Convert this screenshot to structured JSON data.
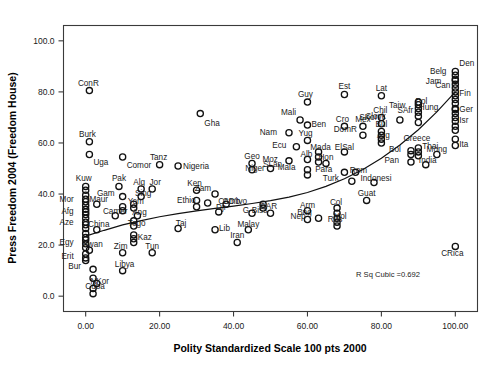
{
  "chart_data": {
    "type": "scatter",
    "title": "",
    "xlabel": "Polity Standardized Scale 100 pts 2000",
    "ylabel": "Press Freedom 2004 (Freedom House)",
    "xlim": [
      -6,
      106
    ],
    "ylim": [
      -6,
      106
    ],
    "xticks": [
      0,
      20,
      40,
      60,
      80,
      100
    ],
    "xticklabels": [
      "0.00",
      "20.00",
      "40.00",
      "60.00",
      "80.00",
      "100.00"
    ],
    "yticks": [
      0,
      20,
      40,
      60,
      80,
      100
    ],
    "yticklabels": [
      "0.0",
      "20.0",
      "40.0",
      "60.0",
      "80.0",
      "100.0"
    ],
    "grid": false,
    "legend": false,
    "annotation": "R Sq Cubic =0.692",
    "fit": {
      "kind": "cubic",
      "r_squared": 0.692,
      "label": "R Sq Cubic =0.692",
      "curve": [
        [
          0,
          23.5
        ],
        [
          5,
          25.8
        ],
        [
          10,
          27.9
        ],
        [
          15,
          29.6
        ],
        [
          20,
          31.1
        ],
        [
          25,
          32.3
        ],
        [
          30,
          33.4
        ],
        [
          35,
          34.4
        ],
        [
          40,
          35.3
        ],
        [
          45,
          36.3
        ],
        [
          50,
          37.4
        ],
        [
          55,
          38.8
        ],
        [
          60,
          40.6
        ],
        [
          65,
          43.0
        ],
        [
          70,
          46.0
        ],
        [
          75,
          49.6
        ],
        [
          80,
          54.0
        ],
        [
          85,
          59.2
        ],
        [
          90,
          65.2
        ],
        [
          95,
          72.2
        ],
        [
          100,
          80.0
        ]
      ]
    },
    "points": [
      {
        "label": "ConR",
        "x": 1,
        "y": 80.5,
        "lx": -1,
        "ly": 8
      },
      {
        "label": "Gha",
        "x": 31,
        "y": 71.5,
        "lx": 4,
        "ly": -9
      },
      {
        "label": "Burk",
        "x": 1,
        "y": 60.5,
        "lx": -2,
        "ly": 8
      },
      {
        "label": "Uga",
        "x": 1,
        "y": 55.5,
        "lx": 4,
        "ly": -8
      },
      {
        "label": "Comor",
        "x": 10,
        "y": 54.5,
        "lx": 4,
        "ly": -8
      },
      {
        "label": "Tanz",
        "x": 20,
        "y": 51.5,
        "lx": -1,
        "ly": 8
      },
      {
        "label": "Nigeria",
        "x": 25,
        "y": 51.0,
        "lx": 5,
        "ly": 0
      },
      {
        "label": "Guy",
        "x": 60,
        "y": 76.0,
        "lx": -2,
        "ly": 8
      },
      {
        "label": "Est",
        "x": 70,
        "y": 79.0,
        "lx": 0,
        "ly": 8
      },
      {
        "label": "Lat",
        "x": 80,
        "y": 78.5,
        "lx": 0,
        "ly": 8
      },
      {
        "label": "Belg",
        "x": 100,
        "y": 85.0,
        "lx": -9,
        "ly": 8
      },
      {
        "label": "Den",
        "x": 100,
        "y": 88.0,
        "lx": 4,
        "ly": 8
      },
      {
        "label": "Jam",
        "x": 100,
        "y": 81.5,
        "lx": -14,
        "ly": 7
      },
      {
        "label": "Can",
        "x": 100,
        "y": 80.0,
        "lx": -5,
        "ly": 7
      },
      {
        "label": "Fin",
        "x": 100,
        "y": 78.5,
        "lx": 4,
        "ly": 3
      },
      {
        "label": "Pol",
        "x": 90,
        "y": 76.0,
        "lx": 3,
        "ly": 1
      },
      {
        "label": "Taiw",
        "x": 90,
        "y": 75.0,
        "lx": -13,
        "ly": 0
      },
      {
        "label": "Mali",
        "x": 58,
        "y": 69.0,
        "lx": -4,
        "ly": 8
      },
      {
        "label": "Ben",
        "x": 60,
        "y": 67.0,
        "lx": 4,
        "ly": 1
      },
      {
        "label": "Chil",
        "x": 80,
        "y": 70.0,
        "lx": -1,
        "ly": 7
      },
      {
        "label": "Cro",
        "x": 70,
        "y": 66.5,
        "lx": -2,
        "ly": 7
      },
      {
        "label": "Mex",
        "x": 75,
        "y": 66.5,
        "lx": 0,
        "ly": 7
      },
      {
        "label": "SKor",
        "x": 80,
        "y": 67.5,
        "lx": -4,
        "ly": 7
      },
      {
        "label": "Hung",
        "x": 100,
        "y": 73.5,
        "lx": -17,
        "ly": 1
      },
      {
        "label": "Ger",
        "x": 100,
        "y": 73.0,
        "lx": 4,
        "ly": 1
      },
      {
        "label": "SAfr",
        "x": 90,
        "y": 70.5,
        "lx": -5,
        "ly": 6
      },
      {
        "label": "Slovk",
        "x": 85,
        "y": 69.0,
        "lx": -14,
        "ly": 4
      },
      {
        "label": "Isr",
        "x": 100,
        "y": 68.5,
        "lx": 4,
        "ly": 1
      },
      {
        "label": "Nam",
        "x": 55,
        "y": 64.0,
        "lx": -12,
        "ly": 1
      },
      {
        "label": "Yug",
        "x": 60,
        "y": 61.0,
        "lx": -2,
        "ly": 7
      },
      {
        "label": "Bul",
        "x": 80,
        "y": 64.5,
        "lx": 0,
        "ly": 7
      },
      {
        "label": "DomR",
        "x": 75,
        "y": 63.0,
        "lx": -6,
        "ly": 6
      },
      {
        "label": "Arg",
        "x": 80,
        "y": 61.5,
        "lx": 2,
        "ly": 4
      },
      {
        "label": "Greece",
        "x": 100,
        "y": 61.5,
        "lx": -25,
        "ly": 1
      },
      {
        "label": "Ita",
        "x": 100,
        "y": 59.0,
        "lx": 4,
        "ly": 2
      },
      {
        "label": "Ecu",
        "x": 57,
        "y": 58.5,
        "lx": -10,
        "ly": 2
      },
      {
        "label": "Mada",
        "x": 63,
        "y": 56.5,
        "lx": 2,
        "ly": 5
      },
      {
        "label": "ElSal",
        "x": 70,
        "y": 56.5,
        "lx": 0,
        "ly": 5
      },
      {
        "label": "Bol",
        "x": 88,
        "y": 57.0,
        "lx": -10,
        "ly": 2
      },
      {
        "label": "Thai",
        "x": 90,
        "y": 58.0,
        "lx": 4,
        "ly": 2
      },
      {
        "label": "Mong",
        "x": 95,
        "y": 55.5,
        "lx": 0,
        "ly": 5
      },
      {
        "label": "Moz",
        "x": 55,
        "y": 53.0,
        "lx": -11,
        "ly": 2
      },
      {
        "label": "Alb",
        "x": 60,
        "y": 53.5,
        "lx": -1,
        "ly": 6
      },
      {
        "label": "Hon",
        "x": 65,
        "y": 52.0,
        "lx": 0,
        "ly": 6
      },
      {
        "label": "Pan",
        "x": 88,
        "y": 52.5,
        "lx": -12,
        "ly": 2
      },
      {
        "label": "India",
        "x": 92,
        "y": 51.5,
        "lx": 2,
        "ly": 5
      },
      {
        "label": "Geo",
        "x": 45,
        "y": 52.0,
        "lx": 0,
        "ly": 7
      },
      {
        "label": "Niger",
        "x": 45,
        "y": 49.5,
        "lx": 3,
        "ly": 2
      },
      {
        "label": "SLan",
        "x": 50,
        "y": 50.0,
        "lx": 2,
        "ly": 5
      },
      {
        "label": "Mala",
        "x": 60,
        "y": 49.5,
        "lx": -12,
        "ly": 3
      },
      {
        "label": "Para",
        "x": 70,
        "y": 48.5,
        "lx": -12,
        "ly": 3
      },
      {
        "label": "Rom",
        "x": 73,
        "y": 48.5,
        "lx": 3,
        "ly": 2
      },
      {
        "label": "Turk",
        "x": 72,
        "y": 45.0,
        "lx": -13,
        "ly": 3
      },
      {
        "label": "Indonesi",
        "x": 78,
        "y": 44.5,
        "lx": 2,
        "ly": 5
      },
      {
        "label": "Kuw",
        "x": 0,
        "y": 43.0,
        "lx": -2,
        "ly": 8
      },
      {
        "label": "Pak",
        "x": 9,
        "y": 43.0,
        "lx": 0,
        "ly": 8
      },
      {
        "label": "Alg",
        "x": 15,
        "y": 42.0,
        "lx": -2,
        "ly": 7
      },
      {
        "label": "Jor",
        "x": 18,
        "y": 42.0,
        "lx": 3,
        "ly": 7
      },
      {
        "label": "Ken",
        "x": 30,
        "y": 41.5,
        "lx": -2,
        "ly": 7
      },
      {
        "label": "Zam",
        "x": 35,
        "y": 40.0,
        "lx": -4,
        "ly": 6
      },
      {
        "label": "Gam",
        "x": 10,
        "y": 39.0,
        "lx": -8,
        "ly": 4
      },
      {
        "label": "Sing",
        "x": 15,
        "y": 39.0,
        "lx": 2,
        "ly": 4
      },
      {
        "label": "Mor",
        "x": 0,
        "y": 37.0,
        "lx": -12,
        "ly": 3
      },
      {
        "label": "Maur",
        "x": 3,
        "y": 36.0,
        "lx": 2,
        "ly": 5
      },
      {
        "label": "Yem",
        "x": 13,
        "y": 36.0,
        "lx": 2,
        "ly": 3
      },
      {
        "label": "Ethio",
        "x": 33,
        "y": 36.5,
        "lx": -12,
        "ly": 3
      },
      {
        "label": "Camb",
        "x": 38,
        "y": 36.0,
        "lx": 3,
        "ly": 3
      },
      {
        "label": "CD'Ivo",
        "x": 48,
        "y": 36.0,
        "lx": -16,
        "ly": 3
      },
      {
        "label": "Afg",
        "x": 0,
        "y": 32.0,
        "lx": -12,
        "ly": 3
      },
      {
        "label": "Camer",
        "x": 8,
        "y": 31.5,
        "lx": 0,
        "ly": 5
      },
      {
        "label": "Ang",
        "x": 14,
        "y": 31.5,
        "lx": 2,
        "ly": 4
      },
      {
        "label": "Dji",
        "x": 36,
        "y": 33.0,
        "lx": 2,
        "ly": 5
      },
      {
        "label": "G-Biss",
        "x": 45,
        "y": 32.5,
        "lx": 3,
        "ly": 3
      },
      {
        "label": "Aze",
        "x": 0,
        "y": 28.0,
        "lx": -12,
        "ly": 3
      },
      {
        "label": "China",
        "x": 3,
        "y": 26.0,
        "lx": 2,
        "ly": 6
      },
      {
        "label": "Togo",
        "x": 13,
        "y": 27.5,
        "lx": 3,
        "ly": 3
      },
      {
        "label": "Taj",
        "x": 25,
        "y": 26.5,
        "lx": 3,
        "ly": 6
      },
      {
        "label": "Lib",
        "x": 35,
        "y": 26.0,
        "lx": 4,
        "ly": 2
      },
      {
        "label": "Malay",
        "x": 44,
        "y": 26.0,
        "lx": 0,
        "ly": 6
      },
      {
        "label": "Arm",
        "x": 60,
        "y": 33.5,
        "lx": 0,
        "ly": 6
      },
      {
        "label": "Col",
        "x": 68,
        "y": 34.5,
        "lx": -1,
        "ly": 6
      },
      {
        "label": "Nep",
        "x": 63,
        "y": 30.5,
        "lx": -13,
        "ly": 2
      },
      {
        "label": "Mol",
        "x": 68,
        "y": 30.5,
        "lx": 3,
        "ly": 2
      },
      {
        "label": "Bng",
        "x": 60,
        "y": 30.0,
        "lx": -3,
        "ly": 8
      },
      {
        "label": "Rus",
        "x": 68,
        "y": 27.5,
        "lx": -2,
        "ly": 7
      },
      {
        "label": "CAR",
        "x": 50,
        "y": 32.5,
        "lx": -2,
        "ly": 7
      },
      {
        "label": "Guat",
        "x": 76,
        "y": 37.5,
        "lx": 0,
        "ly": 7
      },
      {
        "label": "Egy",
        "x": 0,
        "y": 20.5,
        "lx": -12,
        "ly": 2
      },
      {
        "label": "Rwan",
        "x": 1,
        "y": 18.0,
        "lx": 3,
        "ly": 6
      },
      {
        "label": "Kaz",
        "x": 13,
        "y": 21.0,
        "lx": 4,
        "ly": 6
      },
      {
        "label": "Zim",
        "x": 10,
        "y": 17.0,
        "lx": -2,
        "ly": 7
      },
      {
        "label": "Tun",
        "x": 18,
        "y": 17.0,
        "lx": 0,
        "ly": 7
      },
      {
        "label": "Erit",
        "x": 0,
        "y": 15.0,
        "lx": -12,
        "ly": 2
      },
      {
        "label": "Iran",
        "x": 41,
        "y": 21.0,
        "lx": 0,
        "ly": 8
      },
      {
        "label": "Bur",
        "x": 2,
        "y": 10.5,
        "lx": -12,
        "ly": 3
      },
      {
        "label": "Libya",
        "x": 10,
        "y": 10.0,
        "lx": 2,
        "ly": 7
      },
      {
        "label": "NKor",
        "x": 3,
        "y": 5.0,
        "lx": 3,
        "ly": 2
      },
      {
        "label": "Cuba",
        "x": 2,
        "y": 1.0,
        "lx": 2,
        "ly": 8
      },
      {
        "label": "CRica",
        "x": 100,
        "y": 19.5,
        "lx": -3,
        "ly": -7
      },
      {
        "label": "",
        "x": 0,
        "y": 41.5,
        "lx": 0,
        "ly": 0
      },
      {
        "label": "",
        "x": 0,
        "y": 39.5,
        "lx": 0,
        "ly": 0
      },
      {
        "label": "",
        "x": 0,
        "y": 38.0,
        "lx": 0,
        "ly": 0
      },
      {
        "label": "",
        "x": 0,
        "y": 35.5,
        "lx": 0,
        "ly": 0
      },
      {
        "label": "",
        "x": 0,
        "y": 34.0,
        "lx": 0,
        "ly": 0
      },
      {
        "label": "",
        "x": 0,
        "y": 33.0,
        "lx": 0,
        "ly": 0
      },
      {
        "label": "",
        "x": 0,
        "y": 30.5,
        "lx": 0,
        "ly": 0
      },
      {
        "label": "",
        "x": 0,
        "y": 29.0,
        "lx": 0,
        "ly": 0
      },
      {
        "label": "",
        "x": 0,
        "y": 26.5,
        "lx": 0,
        "ly": 0
      },
      {
        "label": "",
        "x": 0,
        "y": 24.5,
        "lx": 0,
        "ly": 0
      },
      {
        "label": "",
        "x": 0,
        "y": 23.0,
        "lx": 0,
        "ly": 0
      },
      {
        "label": "",
        "x": 0,
        "y": 22.0,
        "lx": 0,
        "ly": 0
      },
      {
        "label": "",
        "x": 0,
        "y": 19.0,
        "lx": 0,
        "ly": 0
      },
      {
        "label": "",
        "x": 0,
        "y": 16.5,
        "lx": 0,
        "ly": 0
      },
      {
        "label": "",
        "x": 0,
        "y": 14.0,
        "lx": 0,
        "ly": 0
      },
      {
        "label": "",
        "x": 2,
        "y": 7.0,
        "lx": 0,
        "ly": 0
      },
      {
        "label": "",
        "x": 2,
        "y": 3.0,
        "lx": 0,
        "ly": 0
      },
      {
        "label": "",
        "x": 10,
        "y": 35.0,
        "lx": 0,
        "ly": 0
      },
      {
        "label": "",
        "x": 10,
        "y": 33.5,
        "lx": 0,
        "ly": 0
      },
      {
        "label": "",
        "x": 13,
        "y": 34.5,
        "lx": 0,
        "ly": 0
      },
      {
        "label": "",
        "x": 13,
        "y": 29.5,
        "lx": 0,
        "ly": 0
      },
      {
        "label": "",
        "x": 13,
        "y": 24.0,
        "lx": 0,
        "ly": 0
      },
      {
        "label": "",
        "x": 13,
        "y": 22.5,
        "lx": 0,
        "ly": 0
      },
      {
        "label": "",
        "x": 30,
        "y": 37.5,
        "lx": 0,
        "ly": 0
      },
      {
        "label": "",
        "x": 30,
        "y": 35.0,
        "lx": 0,
        "ly": 0
      },
      {
        "label": "",
        "x": 48,
        "y": 34.5,
        "lx": 0,
        "ly": 0
      },
      {
        "label": "",
        "x": 60,
        "y": 47.5,
        "lx": 0,
        "ly": 0
      },
      {
        "label": "",
        "x": 63,
        "y": 54.5,
        "lx": 0,
        "ly": 0
      },
      {
        "label": "",
        "x": 63,
        "y": 52.5,
        "lx": 0,
        "ly": 0
      },
      {
        "label": "",
        "x": 68,
        "y": 32.5,
        "lx": 0,
        "ly": 0
      },
      {
        "label": "",
        "x": 68,
        "y": 29.0,
        "lx": 0,
        "ly": 0
      },
      {
        "label": "",
        "x": 80,
        "y": 63.0,
        "lx": 0,
        "ly": 0
      },
      {
        "label": "",
        "x": 80,
        "y": 60.0,
        "lx": 0,
        "ly": 0
      },
      {
        "label": "",
        "x": 88,
        "y": 55.5,
        "lx": 0,
        "ly": 0
      },
      {
        "label": "",
        "x": 90,
        "y": 73.5,
        "lx": 0,
        "ly": 0
      },
      {
        "label": "",
        "x": 90,
        "y": 72.0,
        "lx": 0,
        "ly": 0
      },
      {
        "label": "",
        "x": 90,
        "y": 68.0,
        "lx": 0,
        "ly": 0
      },
      {
        "label": "",
        "x": 90,
        "y": 56.5,
        "lx": 0,
        "ly": 0
      },
      {
        "label": "",
        "x": 90,
        "y": 55.0,
        "lx": 0,
        "ly": 0
      },
      {
        "label": "",
        "x": 100,
        "y": 86.5,
        "lx": 0,
        "ly": 0
      },
      {
        "label": "",
        "x": 100,
        "y": 84.5,
        "lx": 0,
        "ly": 0
      },
      {
        "label": "",
        "x": 100,
        "y": 83.0,
        "lx": 0,
        "ly": 0
      },
      {
        "label": "",
        "x": 100,
        "y": 77.0,
        "lx": 0,
        "ly": 0
      },
      {
        "label": "",
        "x": 100,
        "y": 75.5,
        "lx": 0,
        "ly": 0
      },
      {
        "label": "",
        "x": 100,
        "y": 71.5,
        "lx": 0,
        "ly": 0
      },
      {
        "label": "",
        "x": 100,
        "y": 70.0,
        "lx": 0,
        "ly": 0
      },
      {
        "label": "",
        "x": 100,
        "y": 66.5,
        "lx": 0,
        "ly": 0
      },
      {
        "label": "",
        "x": 100,
        "y": 65.0,
        "lx": 0,
        "ly": 0
      }
    ]
  }
}
